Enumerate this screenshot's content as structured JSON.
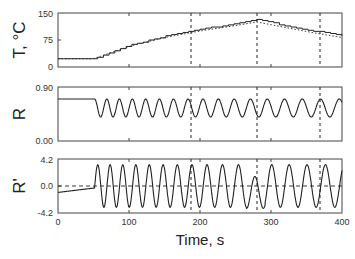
{
  "chart_data": [
    {
      "type": "line",
      "panel": "top",
      "ylabel": "T, °C",
      "ylim": [
        0,
        150
      ],
      "yticks": [
        "0",
        "75",
        "150"
      ],
      "xlim": [
        0,
        400
      ],
      "series": [
        {
          "name": "measured (staircase)",
          "style": "solid",
          "x": [
            0,
            50,
            100,
            150,
            200,
            250,
            280,
            320,
            360,
            400
          ],
          "y": [
            23,
            23,
            60,
            85,
            105,
            120,
            132,
            115,
            100,
            88
          ]
        },
        {
          "name": "reference",
          "style": "dotted",
          "x": [
            0,
            50,
            100,
            150,
            200,
            250,
            280,
            320,
            360,
            400
          ],
          "y": [
            23,
            23,
            57,
            82,
            100,
            115,
            125,
            110,
            95,
            82
          ]
        }
      ],
      "vlines": [
        187,
        280,
        369
      ]
    },
    {
      "type": "line",
      "panel": "middle",
      "ylabel": "R",
      "ylim": [
        0.0,
        0.9
      ],
      "yticks": [
        "0.00",
        "0.90"
      ],
      "xlim": [
        0,
        400
      ],
      "series": [
        {
          "name": "R",
          "style": "solid",
          "description": "flat at ~0.70 until t≈52 s, then oscillates between ~0.40 and ~0.70; period ~17 s early, lengthening to ~27 s later",
          "baseline": 0.7,
          "osc_min": 0.4,
          "osc_max": 0.7,
          "onset_t": 52
        }
      ],
      "vlines": [
        187,
        280,
        369
      ]
    },
    {
      "type": "line",
      "panel": "bottom",
      "ylabel": "R'",
      "ylim": [
        -4.2,
        4.2
      ],
      "yticks": [
        "-4.2",
        "0.0",
        "4.2"
      ],
      "xlim": [
        0,
        400
      ],
      "xticks": [
        "0",
        "100",
        "200",
        "300",
        "400"
      ],
      "xlabel": "Time, s",
      "series": [
        {
          "name": "R'",
          "style": "solid",
          "description": "starts near -1.0 rising to ~-0.3 by t≈52 s, then oscillates between ~±3.3; glitch near t≈280 s",
          "amplitude": 3.3,
          "onset_t": 52
        },
        {
          "name": "zero line",
          "style": "dashed",
          "y": 0.0
        }
      ],
      "vlines": [
        187,
        280,
        369
      ]
    }
  ],
  "labels": {
    "panel1_ylabel": "T, °C",
    "panel2_ylabel": "R",
    "panel3_ylabel": "R'",
    "xlabel": "Time, s",
    "p1_ticks": [
      "150",
      "75",
      "0"
    ],
    "p2_ticks": [
      "0.90",
      "0.00"
    ],
    "p3_ticks": [
      "4.2",
      "0.0",
      "-4.2"
    ],
    "x_ticks": [
      "0",
      "100",
      "200",
      "300",
      "400"
    ]
  }
}
